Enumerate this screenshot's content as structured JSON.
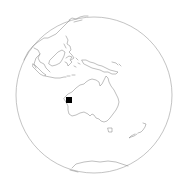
{
  "map": {
    "projection": "orthographic",
    "center_region": "Australia / Oceania",
    "background_color": "#ffffff",
    "outline_color": "#9a9a9a",
    "coastline_color": "#8a8a8a",
    "globe": {
      "cx": 94,
      "cy": 95,
      "r": 78
    },
    "regions_visible": [
      "Australia",
      "Tasmania",
      "New Zealand",
      "New Guinea",
      "Indonesia",
      "Borneo",
      "Philippines",
      "Southeast Asia",
      "Japan",
      "Antarctica"
    ],
    "marker": {
      "shape": "square",
      "color": "#000000",
      "location": "Western Australia (Pilbara)",
      "x": 66,
      "y": 97,
      "size": 6
    }
  }
}
